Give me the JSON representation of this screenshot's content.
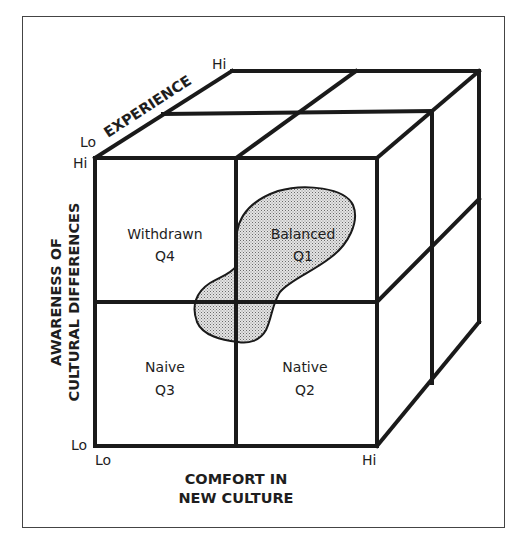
{
  "diagram": {
    "type": "3D cube model",
    "axes": {
      "x": {
        "label_line1": "COMFORT IN",
        "label_line2": "NEW CULTURE",
        "low": "Lo",
        "high": "Hi"
      },
      "y": {
        "label_line1": "AWARENESS OF",
        "label_line2": "CULTURAL DIFFERENCES",
        "low": "Lo",
        "high": "Hi"
      },
      "z": {
        "label": "EXPERIENCE",
        "low": "Lo",
        "high": "Hi"
      }
    },
    "quadrants": [
      {
        "id": "Q4",
        "name": "Withdrawn",
        "code": "Q4",
        "position": "top-left"
      },
      {
        "id": "Q1",
        "name": "Balanced",
        "code": "Q1",
        "position": "top-right"
      },
      {
        "id": "Q3",
        "name": "Naive",
        "code": "Q3",
        "position": "bottom-left"
      },
      {
        "id": "Q2",
        "name": "Native",
        "code": "Q2",
        "position": "bottom-right"
      }
    ],
    "highlight_region": {
      "description": "stippled region centered in Q1, extending into Q4, Q3 and Q2",
      "fill": "#c8c8c8"
    },
    "colors": {
      "line": "#1a1a1a",
      "frame": "#444444",
      "text": "#1e1e1e"
    }
  }
}
